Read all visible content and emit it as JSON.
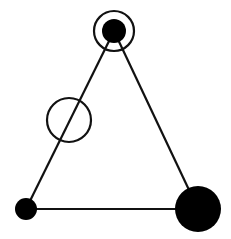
{
  "diagram": {
    "type": "triangle-graph",
    "width": 231,
    "height": 239,
    "colors": {
      "stroke": "#111111",
      "fill": "#000000",
      "background": "#ffffff"
    },
    "edges": [
      {
        "from": "top",
        "to": "bottom-left"
      },
      {
        "from": "top",
        "to": "bottom-right"
      },
      {
        "from": "bottom-left",
        "to": "bottom-right"
      }
    ],
    "nodes": [
      {
        "id": "top",
        "x": 114,
        "y": 31,
        "r": 12,
        "filled": true,
        "ring_r": 20
      },
      {
        "id": "bottom-left",
        "x": 26,
        "y": 209,
        "r": 11,
        "filled": true
      },
      {
        "id": "bottom-right",
        "x": 198,
        "y": 209,
        "r": 23,
        "filled": true
      },
      {
        "id": "open-circle",
        "x": 69,
        "y": 120,
        "r": 22,
        "filled": false
      }
    ]
  }
}
